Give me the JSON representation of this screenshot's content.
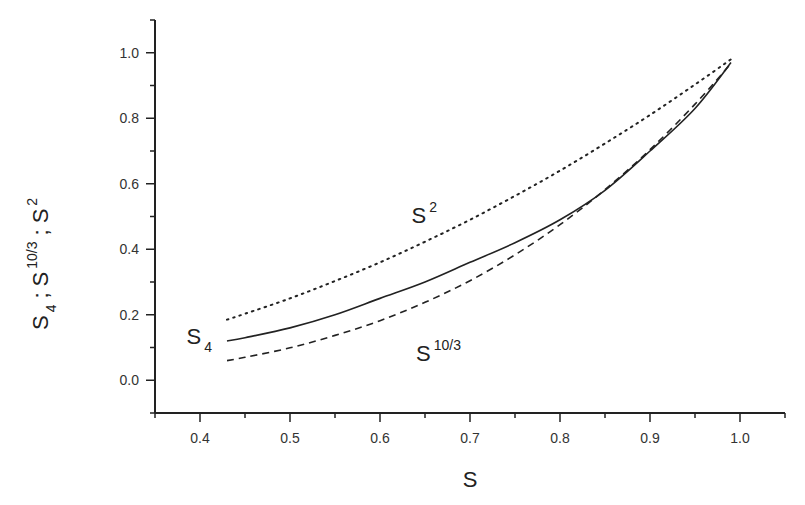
{
  "chart_data": {
    "type": "line",
    "title": "",
    "xlabel": "S",
    "ylabel": "S_4 ; S^10/3 ; S^2",
    "ylabel_parts": {
      "s4_base": "S",
      "s4_sub": "4",
      "sep1": ";",
      "s103_base": "S",
      "s103_sup": "10/3",
      "sep2": ";",
      "s2_base": "S",
      "s2_sup": "2"
    },
    "xlim": [
      0.35,
      1.05
    ],
    "ylim": [
      -0.1,
      1.1
    ],
    "grid": false,
    "legend": "inline labels",
    "xticks": [
      0.4,
      0.5,
      0.6,
      0.7,
      0.8,
      0.9,
      1.0
    ],
    "xtick_labels": [
      "0.4",
      "0.5",
      "0.6",
      "0.7",
      "0.8",
      "0.9",
      "1.0"
    ],
    "xminor": [
      0.35,
      0.45,
      0.55,
      0.65,
      0.75,
      0.85,
      0.95,
      1.05
    ],
    "yticks": [
      0.0,
      0.2,
      0.4,
      0.6,
      0.8,
      1.0
    ],
    "ytick_labels": [
      "0.0",
      "0.2",
      "0.4",
      "0.6",
      "0.8",
      "1.0"
    ],
    "yminor": [
      -0.1,
      0.1,
      0.3,
      0.5,
      0.7,
      0.9,
      1.1
    ],
    "x": [
      0.43,
      0.45,
      0.5,
      0.55,
      0.6,
      0.65,
      0.7,
      0.75,
      0.8,
      0.85,
      0.9,
      0.95,
      0.99
    ],
    "series": [
      {
        "name": "S^2",
        "style": "dotted",
        "values": [
          0.185,
          0.203,
          0.25,
          0.303,
          0.36,
          0.423,
          0.49,
          0.563,
          0.64,
          0.723,
          0.81,
          0.903,
          0.98
        ]
      },
      {
        "name": "S_4",
        "style": "solid",
        "values": [
          0.12,
          0.13,
          0.16,
          0.2,
          0.25,
          0.3,
          0.36,
          0.42,
          0.49,
          0.58,
          0.7,
          0.83,
          0.97
        ]
      },
      {
        "name": "S^10/3",
        "style": "dashed",
        "values": [
          0.06,
          0.07,
          0.099,
          0.137,
          0.182,
          0.238,
          0.304,
          0.383,
          0.475,
          0.582,
          0.704,
          0.843,
          0.967
        ]
      }
    ],
    "annotations": [
      {
        "text": "S^2",
        "base": "S",
        "sup": "2",
        "x": 0.635,
        "y": 0.48
      },
      {
        "text": "S_4",
        "base": "S",
        "sub": "4",
        "x": 0.385,
        "y": 0.11
      },
      {
        "text": "S^10/3",
        "base": "S",
        "sup": "10/3",
        "x": 0.64,
        "y": 0.06
      }
    ]
  }
}
